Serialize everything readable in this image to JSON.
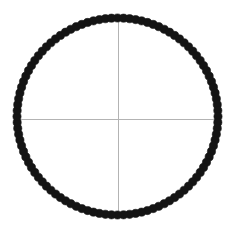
{
  "figure": {
    "title": "",
    "background_color": "#ffffff",
    "width": 233,
    "height": 229
  },
  "axes": {
    "horizontal_axis": {
      "name": "horizontal-crosshair-line",
      "color": "#b3b3b3",
      "thickness": 1,
      "x1": 17.5,
      "y1": 119.0,
      "x2": 218.5,
      "y2": 119.0
    },
    "vertical_axis": {
      "name": "vertical-crosshair-line",
      "color": "#b3b3b3",
      "thickness": 1,
      "x1": 118.0,
      "y1": 19.0,
      "x2": 118.0,
      "y2": 214.0
    }
  },
  "chart_data": {
    "type": "scatter",
    "title": "",
    "xlabel": "",
    "ylabel": "",
    "grid": false,
    "legend": null,
    "marker": {
      "shape": "circle",
      "color": "#141414",
      "size_px": 8.2,
      "edge_color": "#141414"
    },
    "shape": "circle",
    "center": {
      "x": 117.5,
      "y": 116.5
    },
    "radius_x": 100.5,
    "radius_y": 98.5,
    "n_points": 104,
    "xlim": [
      0,
      233
    ],
    "ylim": [
      229,
      0
    ]
  }
}
